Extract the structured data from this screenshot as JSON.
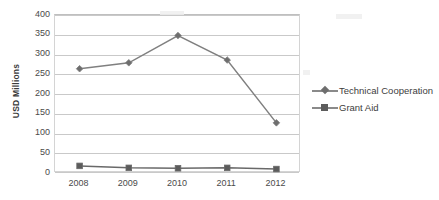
{
  "chart_data": {
    "type": "line",
    "title": "",
    "xlabel": "",
    "ylabel": "USD Millions",
    "categories": [
      "2008",
      "2009",
      "2010",
      "2011",
      "2012"
    ],
    "ylim": [
      0,
      400
    ],
    "ytick_labels": [
      "400",
      "350",
      "300",
      "250",
      "200",
      "150",
      "100",
      "50",
      "0"
    ],
    "ytick_values": [
      400,
      350,
      300,
      250,
      200,
      150,
      100,
      50,
      0
    ],
    "grid": true,
    "legend_position": "right",
    "series": [
      {
        "name": "Technical Cooperation",
        "marker": "diamond",
        "color": "#808080",
        "values": [
          264,
          279,
          348,
          286,
          127
        ]
      },
      {
        "name": "Grant Aid",
        "marker": "square",
        "color": "#696969",
        "values": [
          18,
          13,
          12,
          13,
          10
        ]
      }
    ]
  },
  "legend": {
    "items": [
      {
        "label": "Technical Cooperation",
        "marker": "diamond-marker-icon"
      },
      {
        "label": "Grant Aid",
        "marker": "square-marker-icon"
      }
    ]
  },
  "colors": {
    "series_line": "#808080",
    "gridline": "#c9c9c9",
    "plot_border": "#d4d4d4",
    "text": "#4a4a4a",
    "background": "#ffffff"
  }
}
